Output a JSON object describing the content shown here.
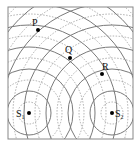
{
  "diagram": {
    "title": "",
    "sources": [
      {
        "label": "S",
        "sub": "1",
        "x": 29,
        "y": 113
      },
      {
        "label": "S",
        "sub": "2",
        "x": 112,
        "y": 113
      }
    ],
    "points": [
      {
        "label": "P",
        "x": 38,
        "y": 30
      },
      {
        "label": "Q",
        "x": 70,
        "y": 58
      },
      {
        "label": "R",
        "x": 102,
        "y": 74
      }
    ],
    "wavefronts": {
      "crest_style": "solid",
      "trough_style": "dotted",
      "spacing": 11,
      "crest_color": "#7a7a7a",
      "trough_color": "#9a9a9a"
    },
    "frame_color": "#888888"
  }
}
